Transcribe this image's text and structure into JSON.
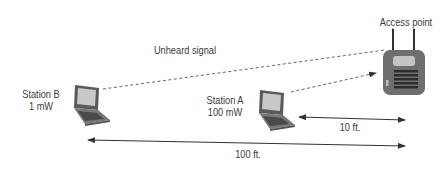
{
  "diagram": {
    "nodes": [
      {
        "id": "station-b",
        "label": "Station B",
        "power": "1 mW"
      },
      {
        "id": "station-a",
        "label": "Station A",
        "power": "100 mW"
      },
      {
        "id": "access-point",
        "label": "Access point"
      }
    ],
    "edges": [
      {
        "from": "station-b",
        "to": "access-point",
        "style": "dashed",
        "label": "Unheard signal"
      },
      {
        "from": "station-a",
        "to": "access-point",
        "style": "dashed-arrow",
        "label": ""
      }
    ],
    "distances": [
      {
        "between": [
          "station-a",
          "access-point"
        ],
        "label": "10 ft."
      },
      {
        "between": [
          "station-b",
          "access-point"
        ],
        "label": "100 ft."
      }
    ],
    "colors": {
      "line": "#555555",
      "device": "#6e6e6e",
      "screen": "#c8c8c8",
      "ap_body": "#707070"
    }
  }
}
